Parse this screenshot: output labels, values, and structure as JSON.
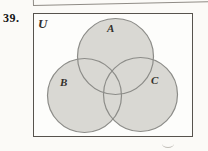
{
  "figure": {
    "problem_number": "39.",
    "universe_label": "U",
    "sets": [
      {
        "label": "A"
      },
      {
        "label": "B"
      },
      {
        "label": "C"
      }
    ],
    "diagram_type": "three-set venn diagram inside universe rectangle"
  },
  "colors": {
    "page_bg": "#fbfaf7",
    "box_bg": "#fdfdfb",
    "box_border": "#57534d",
    "remnant_border": "#8f8b85",
    "circle_fill": "#d9d8d3",
    "circle_stroke": "#8c8c88",
    "label_color": "#33302b",
    "number_color": "#141414",
    "artifact_color": "#b3afa8"
  }
}
